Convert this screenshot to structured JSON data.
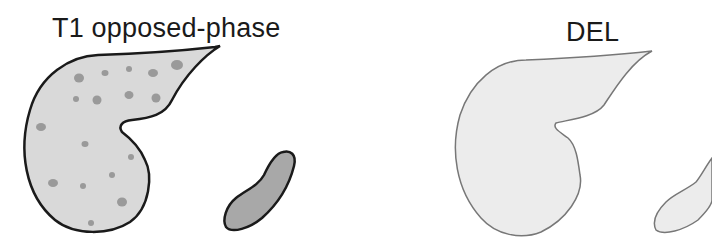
{
  "panels": [
    {
      "title": "T1 opposed-phase",
      "liver": {
        "fill": "#d9d9d9",
        "stroke": "#1a1a1a",
        "lesion_color": "#9a9a9a",
        "lesion_count": 18
      },
      "spleen": {
        "fill": "#a8a8a8",
        "stroke": "#1a1a1a"
      }
    },
    {
      "title": "DEL",
      "liver": {
        "fill": "#ececec",
        "stroke": "#777777"
      },
      "spleen": {
        "fill": "#ececec",
        "stroke": "#777777"
      }
    }
  ]
}
